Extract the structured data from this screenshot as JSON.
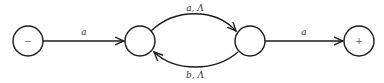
{
  "diagram": {
    "type": "finite-automaton",
    "states": [
      {
        "id": "start",
        "label": "−",
        "cx": 28,
        "cy": 41,
        "r": 15
      },
      {
        "id": "q1",
        "label": "",
        "cx": 140,
        "cy": 41,
        "r": 15
      },
      {
        "id": "q2",
        "label": "",
        "cx": 250,
        "cy": 41,
        "r": 15
      },
      {
        "id": "final",
        "label": "+",
        "cx": 359,
        "cy": 41,
        "r": 15
      }
    ],
    "transitions": [
      {
        "from": "start",
        "to": "q1",
        "label": "a"
      },
      {
        "from": "q1",
        "to": "q2",
        "label": "a, Λ"
      },
      {
        "from": "q2",
        "to": "q1",
        "label": "b, Λ"
      },
      {
        "from": "q2",
        "to": "final",
        "label": "a"
      }
    ],
    "colors": {
      "stroke": "#1a1a1a",
      "background": "#ffffff"
    }
  }
}
